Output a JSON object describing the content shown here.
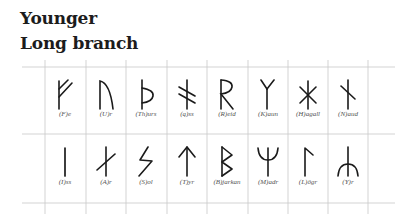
{
  "header": {
    "line1": "Younger",
    "line2": "Long branch"
  },
  "grid": {
    "line_color": "#c8c8c8",
    "rune_color": "#1a1a1a"
  },
  "rows": [
    {
      "runes": [
        {
          "name": "fe",
          "label": "(F)e",
          "icon": "rune-fe-icon"
        },
        {
          "name": "ur",
          "label": "(U)r",
          "icon": "rune-ur-icon"
        },
        {
          "name": "thurs",
          "label": "(Th)urs",
          "icon": "rune-thurs-icon"
        },
        {
          "name": "ass",
          "label": "(ą)ss",
          "icon": "rune-ass-icon"
        },
        {
          "name": "reid",
          "label": "(R)eid",
          "icon": "rune-reid-icon"
        },
        {
          "name": "kaun",
          "label": "(K)aun",
          "icon": "rune-kaun-icon"
        },
        {
          "name": "hagall",
          "label": "(H)agall",
          "icon": "rune-hagall-icon"
        },
        {
          "name": "naud",
          "label": "(N)aud",
          "icon": "rune-naud-icon"
        }
      ]
    },
    {
      "runes": [
        {
          "name": "iss",
          "label": "(I)ss",
          "icon": "rune-iss-icon"
        },
        {
          "name": "ar",
          "label": "(A)r",
          "icon": "rune-ar-icon"
        },
        {
          "name": "sol",
          "label": "(S)ol",
          "icon": "rune-sol-icon"
        },
        {
          "name": "tyr",
          "label": "(T)yr",
          "icon": "rune-tyr-icon"
        },
        {
          "name": "bjarkan",
          "label": "(B)jarkan",
          "icon": "rune-bjarkan-icon"
        },
        {
          "name": "madr",
          "label": "(M)adr",
          "icon": "rune-madr-icon"
        },
        {
          "name": "logr",
          "label": "(L)ögr",
          "icon": "rune-logr-icon"
        },
        {
          "name": "yr",
          "label": "(Y)r",
          "icon": "rune-yr-icon"
        }
      ]
    }
  ]
}
